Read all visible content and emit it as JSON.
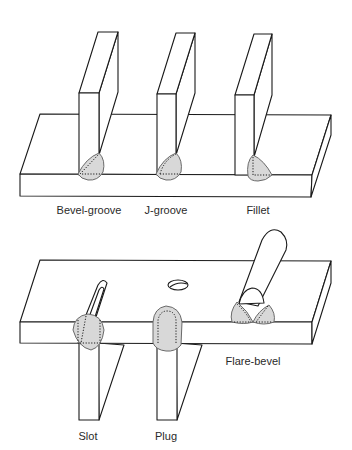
{
  "figure": {
    "top_panel": {
      "labels": [
        {
          "text": "Bevel-groove",
          "x": 89,
          "y": 204
        },
        {
          "text": "J-groove",
          "x": 166,
          "y": 204
        },
        {
          "text": "Fillet",
          "x": 258,
          "y": 204
        }
      ]
    },
    "bottom_panel": {
      "labels": [
        {
          "text": "Slot",
          "x": 88,
          "y": 430
        },
        {
          "text": "Plug",
          "x": 166,
          "y": 430
        },
        {
          "text": "Flare-bevel",
          "x": 253,
          "y": 355
        }
      ]
    },
    "colors": {
      "line": "#1a1a1a",
      "weld_fill": "#d8d8d8",
      "weld_outline": "#6a6a6a",
      "label": "#2a2a2a",
      "background": "#ffffff"
    }
  }
}
